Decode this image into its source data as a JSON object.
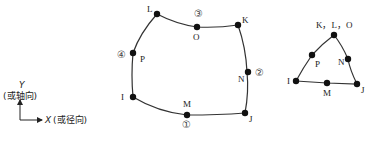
{
  "axes": {
    "y_label": "Y",
    "y_note": "(或轴向)",
    "x_label": "X",
    "x_note": "(或径向)"
  },
  "quad_element": {
    "nodes": {
      "I": "I",
      "J": "J",
      "K": "K",
      "L": "L",
      "M": "M",
      "N": "N",
      "O": "O",
      "P": "P"
    },
    "faces": [
      "①",
      "②",
      "③",
      "④"
    ]
  },
  "tri_element": {
    "apex_label": "K，L，O",
    "nodes": {
      "I": "I",
      "J": "J",
      "M": "M",
      "N": "N",
      "P": "P"
    }
  },
  "colors": {
    "line": "#333333",
    "node": "#111111"
  }
}
